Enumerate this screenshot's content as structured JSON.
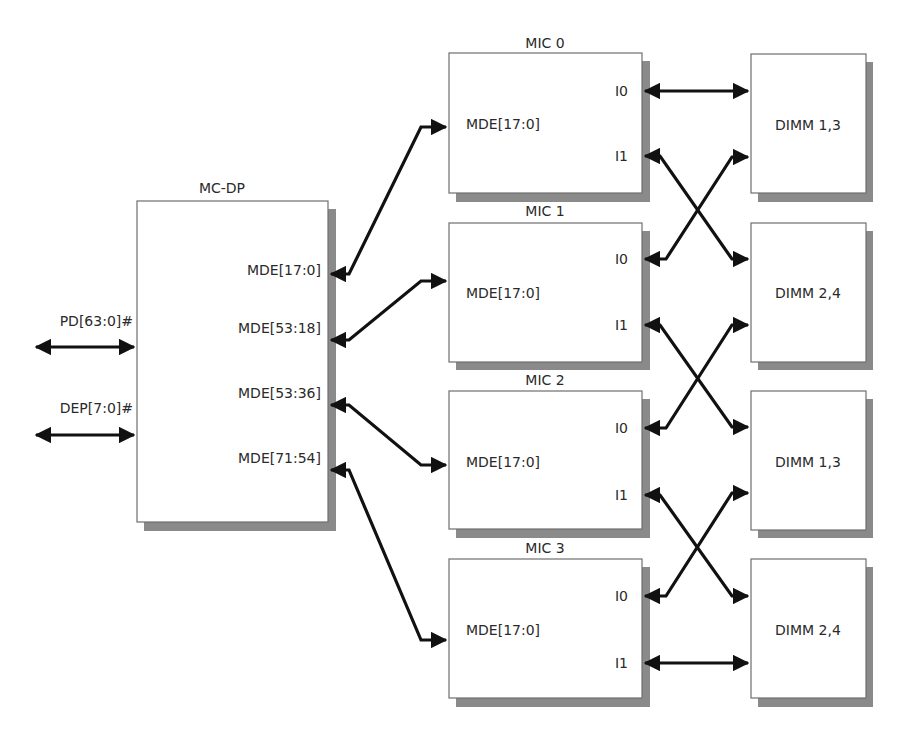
{
  "diagram": {
    "colors": {
      "box_fill": "#ffffff",
      "box_stroke": "#6e6e6e",
      "shadow": "#8a8a8a",
      "wire": "#111111",
      "text": "#2a2a2a"
    },
    "mc_dp": {
      "title": "MC-DP",
      "ports": [
        "MDE[17:0]",
        "MDE[53:18]",
        "MDE[53:36]",
        "MDE[71:54]"
      ]
    },
    "external_signals": [
      {
        "label": "PD[63:0]#",
        "direction": "bidirectional"
      },
      {
        "label": "DEP[7:0]#",
        "direction": "bidirectional"
      }
    ],
    "mics": [
      {
        "title": "MIC 0",
        "data_port": "MDE[17:0]",
        "port_i0": "I0",
        "port_i1": "I1"
      },
      {
        "title": "MIC 1",
        "data_port": "MDE[17:0]",
        "port_i0": "I0",
        "port_i1": "I1"
      },
      {
        "title": "MIC 2",
        "data_port": "MDE[17:0]",
        "port_i0": "I0",
        "port_i1": "I1"
      },
      {
        "title": "MIC 3",
        "data_port": "MDE[17:0]",
        "port_i0": "I0",
        "port_i1": "I1"
      }
    ],
    "dimms": [
      {
        "label": "DIMM 1,3"
      },
      {
        "label": "DIMM 2,4"
      },
      {
        "label": "DIMM 1,3"
      },
      {
        "label": "DIMM 2,4"
      }
    ],
    "connections": [
      {
        "from": "MC-DP MDE[17:0]",
        "to": "MIC 0 MDE[17:0]"
      },
      {
        "from": "MC-DP MDE[53:18]",
        "to": "MIC 1 MDE[17:0]"
      },
      {
        "from": "MC-DP MDE[53:36]",
        "to": "MIC 2 MDE[17:0]"
      },
      {
        "from": "MC-DP MDE[71:54]",
        "to": "MIC 3 MDE[17:0]"
      },
      {
        "from": "MIC 0 I0",
        "to": "DIMM 1,3 (top)"
      },
      {
        "from": "MIC 0 I1",
        "to": "DIMM 2,4 (second)"
      },
      {
        "from": "MIC 1 I0",
        "to": "DIMM 1,3 (top)"
      },
      {
        "from": "MIC 1 I1",
        "to": "DIMM 1,3 (third)"
      },
      {
        "from": "MIC 2 I0",
        "to": "DIMM 2,4 (second)"
      },
      {
        "from": "MIC 2 I1",
        "to": "DIMM 2,4 (bottom)"
      },
      {
        "from": "MIC 3 I0",
        "to": "DIMM 1,3 (third)"
      },
      {
        "from": "MIC 3 I1",
        "to": "DIMM 2,4 (bottom)"
      }
    ]
  }
}
